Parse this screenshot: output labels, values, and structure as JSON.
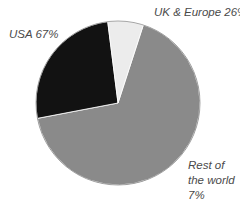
{
  "chart_data": {
    "type": "pie",
    "title": "",
    "categories": [
      "USA",
      "UK & Europe",
      "Rest of the world"
    ],
    "values": [
      67,
      26,
      7
    ],
    "unit": "%",
    "start_angle_deg": 18,
    "direction": "clockwise",
    "colors": [
      "#8a8a8a",
      "#121212",
      "#ececec"
    ],
    "labels": [
      {
        "text": "USA 67%"
      },
      {
        "text": "UK & Europe 26%"
      },
      {
        "lines": [
          "Rest of",
          "the world",
          "7%"
        ]
      }
    ],
    "legend": "none (direct labels)"
  },
  "geometry": {
    "cx": 118,
    "cy": 103,
    "r": 82
  }
}
